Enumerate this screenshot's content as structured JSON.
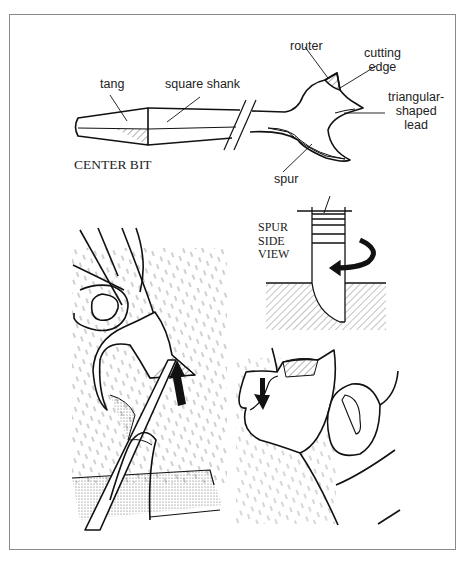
{
  "figure": {
    "title": "CENTER BIT",
    "labels": {
      "tang": "tang",
      "square_shank": "square shank",
      "router": "router",
      "cutting_edge_1": "cutting",
      "cutting_edge_2": "edge",
      "lead_1": "triangular-",
      "lead_2": "shaped",
      "lead_3": "lead",
      "spur": "spur"
    },
    "side_view": {
      "line1": "SPUR",
      "line2": "SIDE",
      "line3": "VIEW"
    },
    "panels": [
      {
        "name": "center-bit-anatomy"
      },
      {
        "name": "filing-spur-illustration"
      },
      {
        "name": "spur-side-view"
      },
      {
        "name": "filing-lead-illustration"
      }
    ]
  }
}
